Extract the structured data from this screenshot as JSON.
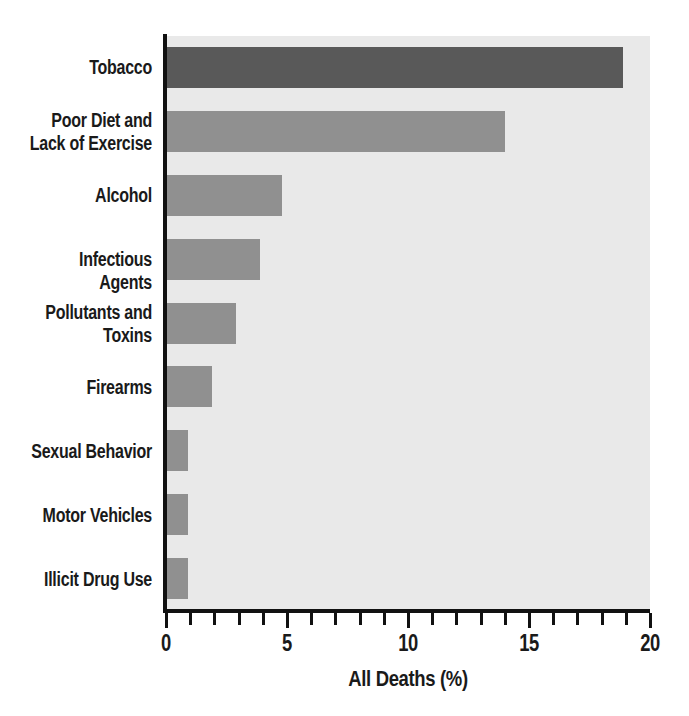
{
  "chart_data": {
    "type": "bar",
    "orientation": "horizontal",
    "title": "",
    "xlabel": "All Deaths (%)",
    "ylabel": "",
    "xlim": [
      0,
      20
    ],
    "ylim": null,
    "grid": false,
    "legend": null,
    "xticks": [
      0,
      5,
      10,
      15,
      20
    ],
    "xticklabels": [
      "0",
      "5",
      "10",
      "15",
      "20"
    ],
    "xminorticks": [
      1,
      2,
      3,
      4,
      6,
      7,
      8,
      9,
      11,
      12,
      13,
      14,
      16,
      17,
      18,
      19
    ],
    "categories": [
      "Tobacco",
      "Poor Diet and Lack of Exercise",
      "Alcohol",
      "Infectious Agents",
      "Pollutants and Toxins",
      "Firearms",
      "Sexual Behavior",
      "Motor Vehicles",
      "Illicit Drug Use"
    ],
    "category_label_lines": [
      [
        "Tobacco"
      ],
      [
        "Poor Diet and",
        "Lack of Exercise"
      ],
      [
        "Alcohol"
      ],
      [
        "Infectious Agents"
      ],
      [
        "Pollutants and",
        "Toxins"
      ],
      [
        "Firearms"
      ],
      [
        "Sexual Behavior"
      ],
      [
        "Motor Vehicles"
      ],
      [
        "Illicit Drug Use"
      ]
    ],
    "values": [
      18.9,
      14.0,
      4.8,
      3.9,
      2.9,
      1.9,
      0.9,
      0.9,
      0.9
    ],
    "bar_colors": [
      "#595959",
      "#909090",
      "#909090",
      "#909090",
      "#909090",
      "#909090",
      "#909090",
      "#909090",
      "#909090"
    ]
  },
  "style": {
    "plot_background": "#e9e9e9",
    "page_background": "#ffffff",
    "axis_color": "#111111",
    "text_color": "#1a1a1a",
    "highlight_bar_color": "#595959",
    "default_bar_color": "#909090"
  }
}
